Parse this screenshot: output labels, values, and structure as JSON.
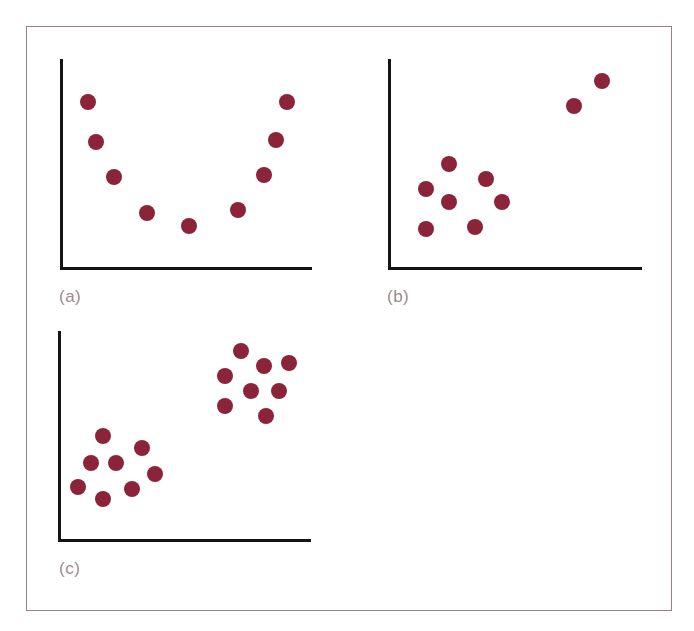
{
  "figure": {
    "border_color": "#a07e86",
    "dot_color": "#8b2438",
    "axis_color": "#151515",
    "label_color": "#9c8a90"
  },
  "panels": [
    {
      "label": "(a)"
    },
    {
      "label": "(b)"
    },
    {
      "label": "(c)"
    }
  ],
  "chart_data": [
    {
      "type": "scatter",
      "title": "(a)",
      "xlabel": "",
      "ylabel": "",
      "xlim": [
        0,
        100
      ],
      "ylim": [
        0,
        100
      ],
      "grid": false,
      "legend": null,
      "ticks": false,
      "description": "U-shaped (quadratic) relationship",
      "x": [
        10.8,
        13.9,
        21.1,
        34.3,
        51.0,
        70.5,
        80.9,
        85.7,
        90.0
      ],
      "y": [
        79.4,
        60.3,
        43.5,
        26.3,
        20.1,
        27.8,
        44.5,
        61.2,
        79.4
      ]
    },
    {
      "type": "scatter",
      "title": "(b)",
      "xlabel": "",
      "ylabel": "",
      "xlim": [
        0,
        100
      ],
      "ylim": [
        0,
        100
      ],
      "grid": false,
      "legend": null,
      "ticks": false,
      "description": "A cluster of points plus two outliers at upper right",
      "x": [
        23.7,
        38.3,
        14.6,
        23.7,
        44.7,
        14.6,
        34.0,
        73.1,
        84.2
      ],
      "y": [
        49.8,
        42.6,
        37.8,
        31.6,
        31.6,
        18.7,
        19.6,
        77.5,
        89.5
      ]
    },
    {
      "type": "scatter",
      "title": "(c)",
      "xlabel": "",
      "ylabel": "",
      "xlim": [
        0,
        100
      ],
      "ylim": [
        0,
        100
      ],
      "grid": false,
      "legend": null,
      "ticks": false,
      "description": "Two separate clusters (lower-left and upper-right)",
      "x": [
        17.5,
        32.9,
        12.7,
        22.6,
        38.1,
        7.5,
        29.0,
        17.5,
        72.2,
        81.3,
        91.3,
        65.9,
        76.2,
        87.3,
        65.9,
        82.1
      ],
      "y": [
        49.8,
        44.0,
        36.8,
        36.8,
        31.6,
        25.4,
        24.4,
        19.6,
        90.4,
        83.3,
        84.7,
        78.5,
        71.3,
        71.3,
        64.1,
        59.3
      ]
    }
  ]
}
